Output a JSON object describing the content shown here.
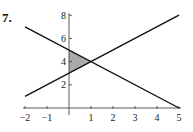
{
  "problem": {
    "number": "7."
  },
  "chart_data": {
    "type": "line",
    "title": "",
    "xlabel": "",
    "ylabel": "",
    "xlim": [
      -2,
      5
    ],
    "ylim": [
      0,
      8
    ],
    "x_ticks": [
      -2,
      -1,
      1,
      2,
      3,
      4,
      5
    ],
    "x_tick_labels": [
      "−2",
      "−1",
      "1",
      "2",
      "3",
      "4",
      "5"
    ],
    "y_ticks": [
      2,
      4,
      6,
      8
    ],
    "y_tick_labels": [
      "2",
      "4",
      "6",
      "8"
    ],
    "grid": false,
    "legend": null,
    "series": [
      {
        "name": "y = -x + 5",
        "x": [
          -2,
          5
        ],
        "y": [
          7,
          0
        ],
        "color": "#111111"
      },
      {
        "name": "y = x + 3",
        "x": [
          -2,
          5
        ],
        "y": [
          1,
          8
        ],
        "color": "#111111"
      }
    ],
    "shaded_region": {
      "vertices": [
        [
          0,
          5
        ],
        [
          0,
          3
        ],
        [
          1,
          4
        ]
      ],
      "fill": "#aaaaaa"
    },
    "intersection": [
      1,
      4
    ]
  }
}
